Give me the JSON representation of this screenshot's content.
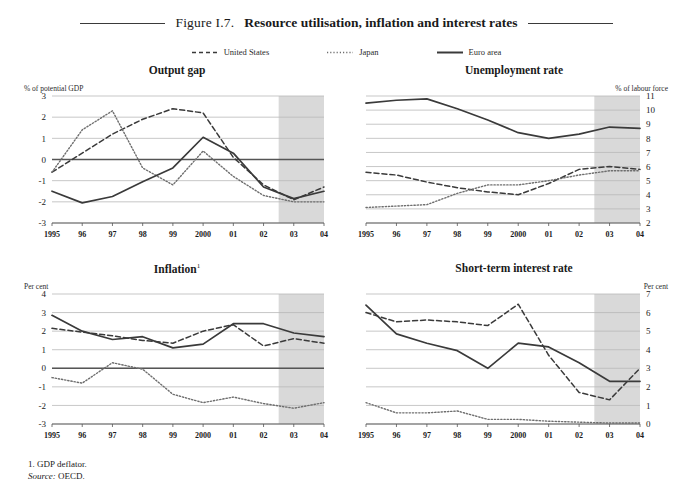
{
  "figure": {
    "number": "Figure I.7.",
    "title": "Resource utilisation, inflation and interest rates"
  },
  "legend": {
    "items": [
      {
        "label": "United States",
        "style": "dashed",
        "color": "#3a3a3a"
      },
      {
        "label": "Japan",
        "style": "dotted",
        "color": "#6a6a6a"
      },
      {
        "label": "Euro area",
        "style": "solid",
        "color": "#3a3a3a"
      }
    ]
  },
  "footnotes": {
    "note1": "1.  GDP deflator.",
    "source_label": "Source:",
    "source_value": "OECD."
  },
  "colors": {
    "forecast_shade": "#d9d9d9",
    "gridline": "#b9b9b9",
    "zero_line": "#555555",
    "axis": "#555555",
    "us_line": "#3a3a3a",
    "japan_line": "#6e6e6e",
    "euro_line": "#3a3a3a"
  },
  "chart_data": [
    {
      "id": "output-gap",
      "type": "line",
      "title": "Output gap",
      "ylabel": "% of potential GDP",
      "ylabel_side": "left",
      "xlabel": "",
      "x": [
        1995,
        1996,
        1997,
        1998,
        1999,
        2000,
        2001,
        2002,
        2003,
        2004
      ],
      "tick_labels": [
        "1995",
        "96",
        "97",
        "98",
        "99",
        "2000",
        "01",
        "02",
        "03",
        "04"
      ],
      "ylim": [
        -3,
        3
      ],
      "yticks": [
        -3,
        -2,
        -1,
        0,
        1,
        2,
        3
      ],
      "grid": true,
      "zero_line": true,
      "forecast_from": 2002.5,
      "series": [
        {
          "name": "United States",
          "style": "dashed",
          "values": [
            -0.6,
            0.3,
            1.2,
            1.9,
            2.4,
            2.2,
            0.1,
            -1.2,
            -1.9,
            -1.3
          ]
        },
        {
          "name": "Japan",
          "style": "dotted",
          "values": [
            -0.6,
            1.4,
            2.3,
            -0.4,
            -1.2,
            0.4,
            -0.8,
            -1.7,
            -2.0,
            -2.0
          ]
        },
        {
          "name": "Euro area",
          "style": "solid",
          "values": [
            -1.5,
            -2.05,
            -1.75,
            -1.05,
            -0.4,
            1.05,
            0.3,
            -1.3,
            -1.85,
            -1.5
          ]
        }
      ]
    },
    {
      "id": "unemployment-rate",
      "type": "line",
      "title": "Unemployment rate",
      "ylabel": "% of labour force",
      "ylabel_side": "right",
      "xlabel": "",
      "x": [
        1995,
        1996,
        1997,
        1998,
        1999,
        2000,
        2001,
        2002,
        2003,
        2004
      ],
      "tick_labels": [
        "1995",
        "96",
        "97",
        "98",
        "99",
        "2000",
        "01",
        "02",
        "03",
        "04"
      ],
      "ylim": [
        2,
        11
      ],
      "yticks": [
        2,
        3,
        4,
        5,
        6,
        7,
        8,
        9,
        10,
        11
      ],
      "grid": true,
      "zero_line": false,
      "forecast_from": 2002.5,
      "series": [
        {
          "name": "United States",
          "style": "dashed",
          "values": [
            5.6,
            5.4,
            4.9,
            4.5,
            4.2,
            4.0,
            4.8,
            5.8,
            6.0,
            5.8
          ]
        },
        {
          "name": "Japan",
          "style": "dotted",
          "values": [
            3.1,
            3.2,
            3.3,
            4.1,
            4.7,
            4.7,
            5.0,
            5.4,
            5.7,
            5.7
          ]
        },
        {
          "name": "Euro area",
          "style": "solid",
          "values": [
            10.5,
            10.7,
            10.8,
            10.1,
            9.3,
            8.4,
            8.0,
            8.3,
            8.8,
            8.7
          ]
        }
      ]
    },
    {
      "id": "inflation",
      "type": "line",
      "title": "Inflation",
      "title_superscript": "1",
      "ylabel": "Per cent",
      "ylabel_side": "left",
      "xlabel": "",
      "x": [
        1995,
        1996,
        1997,
        1998,
        1999,
        2000,
        2001,
        2002,
        2003,
        2004
      ],
      "tick_labels": [
        "1995",
        "96",
        "97",
        "98",
        "99",
        "2000",
        "01",
        "02",
        "03",
        "04"
      ],
      "ylim": [
        -3,
        4
      ],
      "yticks": [
        -3,
        -2,
        -1,
        0,
        1,
        2,
        3,
        4
      ],
      "grid": true,
      "zero_line": true,
      "forecast_from": 2002.5,
      "series": [
        {
          "name": "United States",
          "style": "dashed",
          "values": [
            2.15,
            1.95,
            1.75,
            1.5,
            1.35,
            2.0,
            2.35,
            1.2,
            1.6,
            1.35
          ]
        },
        {
          "name": "Japan",
          "style": "dotted",
          "values": [
            -0.5,
            -0.8,
            0.3,
            -0.05,
            -1.4,
            -1.85,
            -1.55,
            -1.9,
            -2.15,
            -1.85
          ]
        },
        {
          "name": "Euro area",
          "style": "solid",
          "values": [
            2.85,
            2.0,
            1.55,
            1.7,
            1.1,
            1.3,
            2.4,
            2.4,
            1.9,
            1.7
          ]
        }
      ]
    },
    {
      "id": "short-term-interest-rate",
      "type": "line",
      "title": "Short-term interest rate",
      "ylabel": "Per cent",
      "ylabel_side": "right",
      "xlabel": "",
      "x": [
        1995,
        1996,
        1997,
        1998,
        1999,
        2000,
        2001,
        2002,
        2003,
        2004
      ],
      "tick_labels": [
        "1995",
        "96",
        "97",
        "98",
        "99",
        "2000",
        "01",
        "02",
        "03",
        "04"
      ],
      "ylim": [
        0,
        7
      ],
      "yticks": [
        0,
        1,
        2,
        3,
        4,
        5,
        6,
        7
      ],
      "grid": true,
      "zero_line": false,
      "forecast_from": 2002.5,
      "series": [
        {
          "name": "United States",
          "style": "dashed",
          "values": [
            6.0,
            5.5,
            5.6,
            5.5,
            5.3,
            6.45,
            3.7,
            1.7,
            1.3,
            3.0
          ]
        },
        {
          "name": "Japan",
          "style": "dotted",
          "values": [
            1.15,
            0.6,
            0.6,
            0.7,
            0.25,
            0.25,
            0.15,
            0.1,
            0.05,
            0.05
          ]
        },
        {
          "name": "Euro area",
          "style": "solid",
          "values": [
            6.4,
            4.85,
            4.35,
            3.95,
            3.0,
            4.35,
            4.15,
            3.3,
            2.3,
            2.3
          ]
        }
      ]
    }
  ]
}
